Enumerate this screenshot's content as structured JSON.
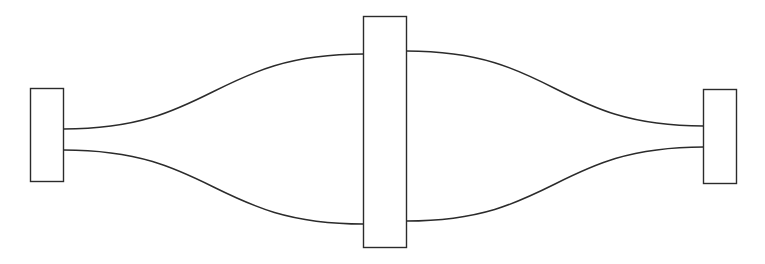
{
  "diagram": {
    "type": "flow-links",
    "nodes": [
      {
        "id": "left",
        "label": ""
      },
      {
        "id": "center",
        "label": ""
      },
      {
        "id": "right",
        "label": ""
      }
    ],
    "edges": [
      {
        "id": "upper-left",
        "from": "left",
        "to": "center"
      },
      {
        "id": "lower-left",
        "from": "left",
        "to": "center"
      },
      {
        "id": "upper-right",
        "from": "center",
        "to": "right"
      },
      {
        "id": "lower-right",
        "from": "center",
        "to": "right"
      }
    ],
    "colors": {
      "stroke": "#2b2b2b",
      "fill": "#ffffff",
      "background": "#ffffff"
    }
  }
}
